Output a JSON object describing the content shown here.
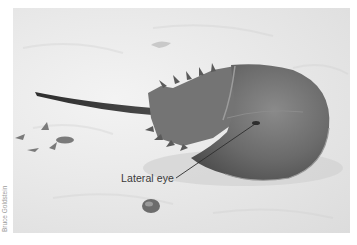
{
  "figure": {
    "annotation": {
      "label": "Lateral eye"
    },
    "credit": "Bruce Goldstein",
    "colors": {
      "sand": "#e8e8e8",
      "shell": "#6e6e6e",
      "shell_dark": "#4a4a4a",
      "label": "#3a3a3a",
      "credit": "#9a9a9a"
    }
  }
}
